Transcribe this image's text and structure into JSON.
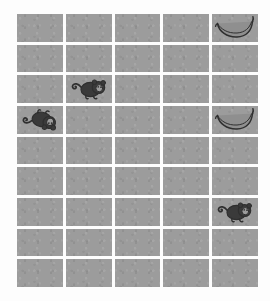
{
  "board": {
    "name": "memory-match-board",
    "columns": 5,
    "rows": 9,
    "cell_color": "#9c9c9c",
    "gap_color": "#ffffff",
    "background_color": "#fdfdfd",
    "icon_color": "#333333",
    "total_cells": 45,
    "cells": [
      {
        "row": 1,
        "col": 1,
        "icon": null,
        "label": "empty-tile"
      },
      {
        "row": 1,
        "col": 2,
        "icon": null,
        "label": "empty-tile"
      },
      {
        "row": 1,
        "col": 3,
        "icon": null,
        "label": "empty-tile"
      },
      {
        "row": 1,
        "col": 4,
        "icon": null,
        "label": "empty-tile"
      },
      {
        "row": 1,
        "col": 5,
        "icon": "banana",
        "label": "banana-tile",
        "orientation": "upright"
      },
      {
        "row": 2,
        "col": 1,
        "icon": null,
        "label": "empty-tile"
      },
      {
        "row": 2,
        "col": 2,
        "icon": null,
        "label": "empty-tile"
      },
      {
        "row": 2,
        "col": 3,
        "icon": null,
        "label": "empty-tile"
      },
      {
        "row": 2,
        "col": 4,
        "icon": null,
        "label": "empty-tile"
      },
      {
        "row": 2,
        "col": 5,
        "icon": null,
        "label": "empty-tile"
      },
      {
        "row": 3,
        "col": 1,
        "icon": null,
        "label": "empty-tile"
      },
      {
        "row": 3,
        "col": 2,
        "icon": "monkey",
        "label": "monkey-tile",
        "orientation": "upright"
      },
      {
        "row": 3,
        "col": 3,
        "icon": null,
        "label": "empty-tile"
      },
      {
        "row": 3,
        "col": 4,
        "icon": null,
        "label": "empty-tile"
      },
      {
        "row": 3,
        "col": 5,
        "icon": null,
        "label": "empty-tile"
      },
      {
        "row": 4,
        "col": 1,
        "icon": "monkey",
        "label": "monkey-tile",
        "orientation": "flipped"
      },
      {
        "row": 4,
        "col": 2,
        "icon": null,
        "label": "empty-tile"
      },
      {
        "row": 4,
        "col": 3,
        "icon": null,
        "label": "empty-tile"
      },
      {
        "row": 4,
        "col": 4,
        "icon": null,
        "label": "empty-tile"
      },
      {
        "row": 4,
        "col": 5,
        "icon": "banana",
        "label": "banana-tile",
        "orientation": "upright"
      },
      {
        "row": 5,
        "col": 1,
        "icon": null,
        "label": "empty-tile"
      },
      {
        "row": 5,
        "col": 2,
        "icon": null,
        "label": "empty-tile"
      },
      {
        "row": 5,
        "col": 3,
        "icon": null,
        "label": "empty-tile"
      },
      {
        "row": 5,
        "col": 4,
        "icon": null,
        "label": "empty-tile"
      },
      {
        "row": 5,
        "col": 5,
        "icon": null,
        "label": "empty-tile"
      },
      {
        "row": 6,
        "col": 1,
        "icon": null,
        "label": "empty-tile"
      },
      {
        "row": 6,
        "col": 2,
        "icon": null,
        "label": "empty-tile"
      },
      {
        "row": 6,
        "col": 3,
        "icon": null,
        "label": "empty-tile"
      },
      {
        "row": 6,
        "col": 4,
        "icon": null,
        "label": "empty-tile"
      },
      {
        "row": 6,
        "col": 5,
        "icon": null,
        "label": "empty-tile"
      },
      {
        "row": 7,
        "col": 1,
        "icon": null,
        "label": "empty-tile"
      },
      {
        "row": 7,
        "col": 2,
        "icon": null,
        "label": "empty-tile"
      },
      {
        "row": 7,
        "col": 3,
        "icon": null,
        "label": "empty-tile"
      },
      {
        "row": 7,
        "col": 4,
        "icon": null,
        "label": "empty-tile"
      },
      {
        "row": 7,
        "col": 5,
        "icon": "monkey",
        "label": "monkey-tile",
        "orientation": "upright"
      },
      {
        "row": 8,
        "col": 1,
        "icon": null,
        "label": "empty-tile"
      },
      {
        "row": 8,
        "col": 2,
        "icon": null,
        "label": "empty-tile"
      },
      {
        "row": 8,
        "col": 3,
        "icon": null,
        "label": "empty-tile"
      },
      {
        "row": 8,
        "col": 4,
        "icon": null,
        "label": "empty-tile"
      },
      {
        "row": 8,
        "col": 5,
        "icon": null,
        "label": "empty-tile"
      },
      {
        "row": 9,
        "col": 1,
        "icon": null,
        "label": "empty-tile"
      },
      {
        "row": 9,
        "col": 2,
        "icon": null,
        "label": "empty-tile"
      },
      {
        "row": 9,
        "col": 3,
        "icon": null,
        "label": "empty-tile"
      },
      {
        "row": 9,
        "col": 4,
        "icon": null,
        "label": "empty-tile"
      },
      {
        "row": 9,
        "col": 5,
        "icon": null,
        "label": "empty-tile"
      }
    ]
  }
}
